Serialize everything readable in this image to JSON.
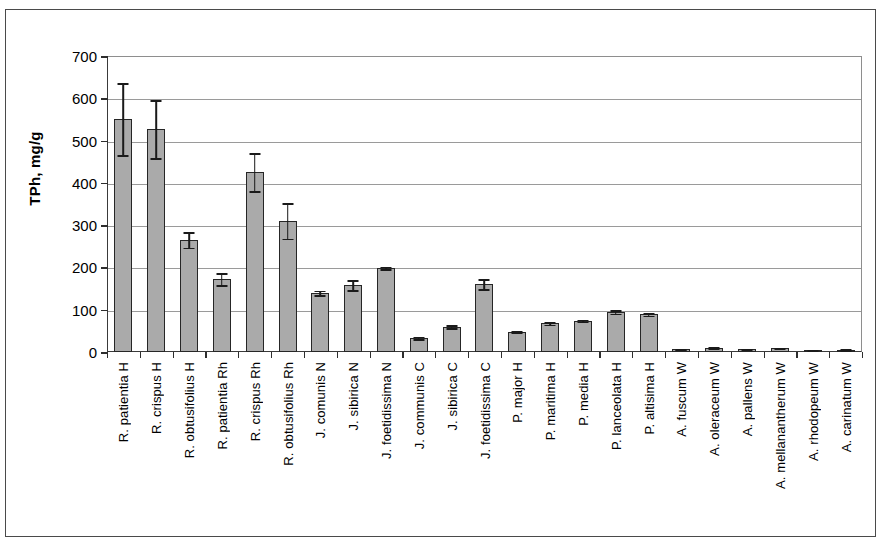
{
  "chart_data": {
    "type": "bar",
    "title": "",
    "xlabel": "",
    "ylabel": "TPh, mg/g",
    "ylim": [
      0,
      700
    ],
    "ytick_values": [
      0,
      100,
      200,
      300,
      400,
      500,
      600,
      700
    ],
    "ytick_labels": [
      "0",
      "100",
      "200",
      "300",
      "400",
      "500",
      "600",
      "700"
    ],
    "grid": true,
    "legend": "none",
    "error_bars": true,
    "bar_color": "#aaaaaa",
    "bar_edge_color": "#262626",
    "categories": [
      "R. patientia H",
      "R. crispus H",
      "R. obtusifolius H",
      "R. patientia Rh",
      "R. crispus Rh",
      "R. obtusifolius Rh",
      "J. comunis N",
      "J. sibirica N",
      "J. foetidissima N",
      "J. communis C",
      "J. sibirica C",
      "J. foetidissima C",
      "P. major H",
      "P. maritima H",
      "P. media H",
      "P. lanceolata H",
      "P. altisima H",
      "A. fuscum W",
      "A. oleraceum W",
      "A. pallens W",
      "A. mellanantherum W",
      "A. rhodopeum W",
      "A. carinatum W"
    ],
    "values": [
      550,
      527,
      265,
      172,
      425,
      310,
      140,
      158,
      199,
      33,
      60,
      160,
      48,
      68,
      74,
      95,
      89,
      6,
      10,
      7,
      9,
      4,
      5
    ],
    "errors": [
      85,
      68,
      18,
      14,
      45,
      42,
      5,
      12,
      3,
      3,
      4,
      12,
      1,
      3,
      2,
      4,
      3,
      1,
      1,
      1,
      1,
      1,
      1
    ]
  }
}
